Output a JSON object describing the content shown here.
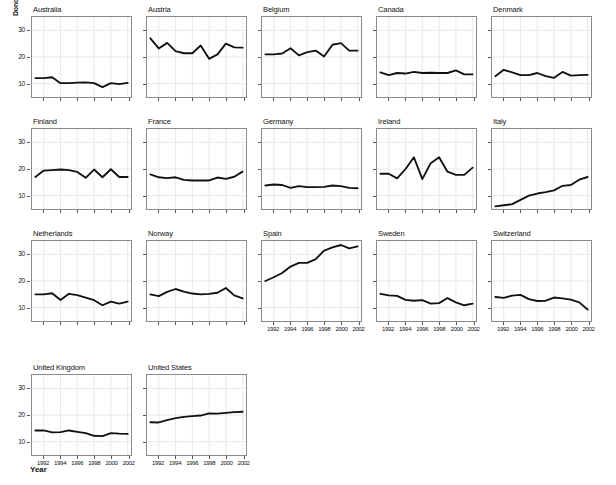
{
  "chart_data": {
    "type": "line",
    "title": "",
    "xlabel": "Year",
    "ylabel": "Donors",
    "xlim": [
      1990.6,
      2002.4
    ],
    "ylim": [
      5,
      35
    ],
    "yticks": [
      10,
      20,
      30
    ],
    "xticks": [
      1992,
      1994,
      1996,
      1998,
      2000,
      2002
    ],
    "xtick_labels": [
      "1992",
      "1994",
      "1996",
      "1998",
      "2000",
      "2002"
    ],
    "ytick_labels": [
      "10",
      "20",
      "30"
    ],
    "grid": true,
    "legend": "none",
    "x": [
      1991,
      1992,
      1993,
      1994,
      1995,
      1996,
      1997,
      1998,
      1999,
      2000,
      2001,
      2002
    ],
    "series": [
      {
        "name": "Australia",
        "values": [
          12.1,
          12.1,
          12.4,
          10.2,
          10.2,
          10.4,
          10.5,
          10.2,
          8.7,
          10.2,
          9.8,
          10.3
        ]
      },
      {
        "name": "Austria",
        "values": [
          27.0,
          23.2,
          25.3,
          22.2,
          21.4,
          21.4,
          24.3,
          19.3,
          21.0,
          25.0,
          23.6,
          23.5
        ]
      },
      {
        "name": "Belgium",
        "values": [
          21.0,
          21.0,
          21.3,
          23.3,
          20.6,
          21.8,
          22.4,
          20.2,
          24.6,
          25.2,
          22.4,
          22.4
        ]
      },
      {
        "name": "Canada",
        "values": [
          14.2,
          13.2,
          14.0,
          13.8,
          14.4,
          14.0,
          14.1,
          14.0,
          14.0,
          15.0,
          13.5,
          13.5
        ]
      },
      {
        "name": "Denmark",
        "values": [
          12.8,
          15.2,
          14.2,
          13.2,
          13.2,
          14.0,
          12.8,
          12.2,
          14.4,
          13.0,
          13.2,
          13.3
        ]
      },
      {
        "name": "Finland",
        "values": [
          17.0,
          19.4,
          19.6,
          19.8,
          19.6,
          18.9,
          16.7,
          19.8,
          16.9,
          19.9,
          17.0,
          17.0
        ]
      },
      {
        "name": "France",
        "values": [
          18.0,
          16.9,
          16.6,
          16.9,
          15.9,
          15.7,
          15.7,
          15.7,
          16.8,
          16.3,
          17.1,
          19.0
        ]
      },
      {
        "name": "Germany",
        "values": [
          13.8,
          14.2,
          14.0,
          12.9,
          13.6,
          13.2,
          13.2,
          13.3,
          13.8,
          13.6,
          12.9,
          12.8
        ]
      },
      {
        "name": "Ireland",
        "values": [
          18.2,
          18.2,
          16.5,
          20.0,
          24.4,
          16.2,
          22.2,
          24.4,
          19.0,
          17.8,
          17.8,
          20.5
        ]
      },
      {
        "name": "Italy",
        "values": [
          6.0,
          6.4,
          6.8,
          8.4,
          10.0,
          10.8,
          11.3,
          12.0,
          13.7,
          14.0,
          16.0,
          17.0
        ]
      },
      {
        "name": "Netherlands",
        "values": [
          15.0,
          15.0,
          15.4,
          12.9,
          15.2,
          14.7,
          13.8,
          12.8,
          10.9,
          12.3,
          11.5,
          12.3
        ]
      },
      {
        "name": "Norway",
        "values": [
          15.0,
          14.3,
          15.9,
          17.0,
          16.0,
          15.3,
          15.0,
          15.2,
          15.6,
          17.4,
          14.6,
          13.5
        ]
      },
      {
        "name": "Spain",
        "values": [
          20.0,
          21.4,
          23.0,
          25.4,
          26.8,
          26.8,
          28.2,
          31.4,
          32.6,
          33.5,
          32.2,
          33.0
        ]
      },
      {
        "name": "Sweden",
        "values": [
          15.2,
          14.6,
          14.4,
          12.9,
          12.6,
          12.8,
          11.5,
          11.7,
          13.6,
          12.0,
          10.9,
          11.5
        ]
      },
      {
        "name": "Switzerland",
        "values": [
          14.0,
          13.7,
          14.5,
          14.8,
          13.2,
          12.5,
          12.6,
          13.8,
          13.5,
          13.0,
          12.0,
          9.3
        ]
      },
      {
        "name": "United Kingdom",
        "values": [
          14.2,
          14.2,
          13.5,
          13.6,
          14.2,
          13.7,
          13.2,
          12.2,
          12.1,
          13.2,
          13.0,
          12.9
        ]
      },
      {
        "name": "United States",
        "values": [
          17.3,
          17.2,
          18.1,
          18.8,
          19.3,
          19.6,
          19.8,
          20.6,
          20.5,
          20.8,
          21.1,
          21.2
        ]
      }
    ]
  },
  "panels": [
    {
      "title": "Australia",
      "row": 0,
      "col": 0
    },
    {
      "title": "Austria",
      "row": 0,
      "col": 1
    },
    {
      "title": "Belgium",
      "row": 0,
      "col": 2
    },
    {
      "title": "Canada",
      "row": 0,
      "col": 3
    },
    {
      "title": "Denmark",
      "row": 0,
      "col": 4
    },
    {
      "title": "Finland",
      "row": 1,
      "col": 0
    },
    {
      "title": "France",
      "row": 1,
      "col": 1
    },
    {
      "title": "Germany",
      "row": 1,
      "col": 2
    },
    {
      "title": "Ireland",
      "row": 1,
      "col": 3
    },
    {
      "title": "Italy",
      "row": 1,
      "col": 4
    },
    {
      "title": "Netherlands",
      "row": 2,
      "col": 0
    },
    {
      "title": "Norway",
      "row": 2,
      "col": 1
    },
    {
      "title": "Spain",
      "row": 2,
      "col": 2
    },
    {
      "title": "Sweden",
      "row": 2,
      "col": 3
    },
    {
      "title": "Switzerland",
      "row": 2,
      "col": 4
    },
    {
      "title": "United Kingdom",
      "row": 3,
      "col": 0
    },
    {
      "title": "United States",
      "row": 3,
      "col": 1
    }
  ],
  "style": {
    "line_color": "#111111",
    "grid_color": "#e8e8e8",
    "frame_color": "#8a8a8a",
    "background": "#ffffff"
  }
}
